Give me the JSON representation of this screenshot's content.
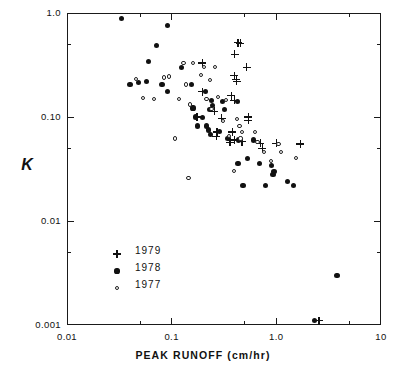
{
  "axes": {
    "x_title": "PEAK RUNOFF (cm/hr)",
    "y_title": "K",
    "x_ticks": [
      "0.01",
      "0.1",
      "1.0",
      "10"
    ],
    "y_ticks": [
      "1.0",
      "0.10",
      "0.01",
      "0.001"
    ]
  },
  "legend": {
    "entries": [
      {
        "symbol": "plus-marker",
        "label": "1979"
      },
      {
        "symbol": "filled-circle-marker",
        "label": "1978"
      },
      {
        "symbol": "open-circle-marker",
        "label": "1977"
      }
    ]
  },
  "chart_data": {
    "type": "scatter",
    "title": "",
    "xlabel": "PEAK RUNOFF (cm/hr)",
    "ylabel": "K",
    "xscale": "log",
    "yscale": "log",
    "xlim": [
      0.01,
      10
    ],
    "ylim": [
      0.001,
      1.0
    ],
    "grid": false,
    "legend_position": "lower-left-inside",
    "x_tick_labels": [
      "0.01",
      "0.1",
      "1.0",
      "10"
    ],
    "y_tick_labels": [
      "1.0",
      "0.10",
      "0.01",
      "0.001"
    ],
    "x_major_ticks": [
      0.01,
      0.1,
      1.0,
      10
    ],
    "y_major_ticks": [
      1.0,
      0.1,
      0.01,
      0.001
    ],
    "x_minor_ticks": [
      0.05,
      0.5,
      5
    ],
    "y_minor_ticks": [
      0.5,
      0.05,
      0.005
    ],
    "series": [
      {
        "name": "1979",
        "marker": "plus",
        "points": [
          [
            0.196,
            0.33
          ],
          [
            0.43,
            0.52
          ],
          [
            0.452,
            0.51
          ],
          [
            0.4,
            0.4
          ],
          [
            0.52,
            0.3
          ],
          [
            0.395,
            0.25
          ],
          [
            0.415,
            0.23
          ],
          [
            0.417,
            0.22
          ],
          [
            0.196,
            0.175
          ],
          [
            0.37,
            0.16
          ],
          [
            0.397,
            0.145
          ],
          [
            0.255,
            0.113
          ],
          [
            0.175,
            0.1
          ],
          [
            0.3,
            0.097
          ],
          [
            0.54,
            0.1
          ],
          [
            0.54,
            0.093
          ],
          [
            0.27,
            0.072
          ],
          [
            0.38,
            0.072
          ],
          [
            0.268,
            0.065
          ],
          [
            0.395,
            0.06
          ],
          [
            0.36,
            0.057
          ],
          [
            0.47,
            0.058
          ],
          [
            0.7,
            0.056
          ],
          [
            1.0,
            0.056
          ],
          [
            1.7,
            0.055
          ],
          [
            0.735,
            0.05
          ],
          [
            2.55,
            0.0011
          ]
        ]
      },
      {
        "name": "1978",
        "marker": "filled-circle",
        "points": [
          [
            0.033,
            0.88
          ],
          [
            0.092,
            0.76
          ],
          [
            0.072,
            0.49
          ],
          [
            0.06,
            0.34
          ],
          [
            0.048,
            0.215
          ],
          [
            0.057,
            0.22
          ],
          [
            0.081,
            0.205
          ],
          [
            0.092,
            0.175
          ],
          [
            0.04,
            0.205
          ],
          [
            0.125,
            0.3
          ],
          [
            0.154,
            0.205
          ],
          [
            0.16,
            0.122
          ],
          [
            0.168,
            0.1
          ],
          [
            0.175,
            0.082
          ],
          [
            0.21,
            0.175
          ],
          [
            0.24,
            0.145
          ],
          [
            0.245,
            0.13
          ],
          [
            0.231,
            0.118
          ],
          [
            0.196,
            0.098
          ],
          [
            0.215,
            0.082
          ],
          [
            0.225,
            0.075
          ],
          [
            0.233,
            0.068
          ],
          [
            0.305,
            0.14
          ],
          [
            0.32,
            0.118
          ],
          [
            0.285,
            0.072
          ],
          [
            0.345,
            0.062
          ],
          [
            0.425,
            0.14
          ],
          [
            0.437,
            0.06
          ],
          [
            0.6,
            0.06
          ],
          [
            0.43,
            0.036
          ],
          [
            0.53,
            0.04
          ],
          [
            0.69,
            0.036
          ],
          [
            0.9,
            0.034
          ],
          [
            0.95,
            0.03
          ],
          [
            0.93,
            0.028
          ],
          [
            0.48,
            0.022
          ],
          [
            0.79,
            0.022
          ],
          [
            1.28,
            0.024
          ],
          [
            1.45,
            0.022
          ],
          [
            2.3,
            0.0011
          ],
          [
            3.8,
            0.003
          ]
        ]
      },
      {
        "name": "1977",
        "marker": "open-circle",
        "points": [
          [
            0.046,
            0.23
          ],
          [
            0.053,
            0.152
          ],
          [
            0.068,
            0.15
          ],
          [
            0.085,
            0.24
          ],
          [
            0.095,
            0.245
          ],
          [
            0.107,
            0.062
          ],
          [
            0.118,
            0.15
          ],
          [
            0.13,
            0.33
          ],
          [
            0.138,
            0.205
          ],
          [
            0.15,
            0.132
          ],
          [
            0.16,
            0.33
          ],
          [
            0.19,
            0.255
          ],
          [
            0.205,
            0.3
          ],
          [
            0.215,
            0.15
          ],
          [
            0.232,
            0.225
          ],
          [
            0.24,
            0.12
          ],
          [
            0.26,
            0.3
          ],
          [
            0.275,
            0.155
          ],
          [
            0.31,
            0.092
          ],
          [
            0.33,
            0.145
          ],
          [
            0.352,
            0.066
          ],
          [
            0.42,
            0.095
          ],
          [
            0.445,
            0.082
          ],
          [
            0.455,
            0.062
          ],
          [
            0.47,
            0.072
          ],
          [
            0.62,
            0.072
          ],
          [
            0.66,
            0.058
          ],
          [
            0.76,
            0.046
          ],
          [
            0.89,
            0.038
          ],
          [
            1.05,
            0.055
          ],
          [
            1.11,
            0.046
          ],
          [
            1.55,
            0.04
          ],
          [
            0.395,
            0.03
          ],
          [
            0.145,
            0.026
          ]
        ]
      }
    ]
  }
}
